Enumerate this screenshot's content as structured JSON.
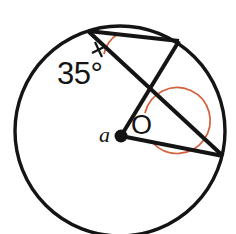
{
  "figure": {
    "kind": "circle-geometry-diagram",
    "background_color": "#ffffff",
    "stroke_color": "#141414",
    "arc_color": "#d4613c",
    "labels": {
      "inscribed_angle": "35°",
      "center_point": "O",
      "central_angle": "a"
    },
    "circle": {
      "center_x": 120,
      "center_y": 131,
      "radius": 105
    },
    "points": {
      "top_left_vertex": {
        "x": 88,
        "y": 31
      },
      "upper_right_vertex": {
        "x": 179,
        "y": 41
      },
      "right_vertex": {
        "x": 223,
        "y": 156
      },
      "center": {
        "x": 121,
        "y": 136
      }
    },
    "segments": [
      {
        "name": "chord-top",
        "from": "top_left_vertex",
        "to": "upper_right_vertex"
      },
      {
        "name": "radius-upper-right",
        "from": "center",
        "to": "upper_right_vertex"
      },
      {
        "name": "radius-right",
        "from": "center",
        "to": "right_vertex"
      },
      {
        "name": "chord-through-center",
        "from": "top_left_vertex",
        "to": "right_vertex"
      }
    ],
    "arcs": {
      "inscribed_arc": {
        "at": "top_left_vertex",
        "color": "#d4613c"
      },
      "reflex_arc": {
        "at": "center",
        "color": "#d4613c",
        "radius": 33
      }
    },
    "tick_mark": {
      "at": "top_left_vertex",
      "color": "#141414"
    }
  }
}
